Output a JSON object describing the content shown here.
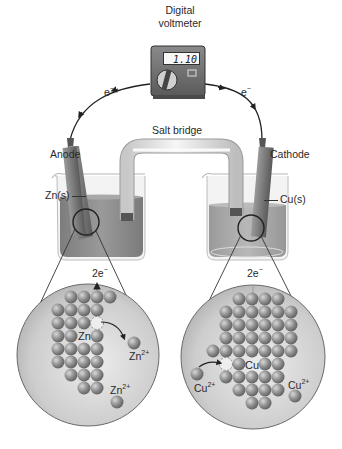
{
  "voltmeter": {
    "label_line1": "Digital",
    "label_line2": "voltmeter",
    "reading": "1.10"
  },
  "wires": {
    "left_electron": "e",
    "right_electron": "e",
    "electron_charge": "−"
  },
  "salt_bridge": {
    "label": "Salt bridge"
  },
  "anode": {
    "label": "Anode",
    "electrode_label": "Zn(s)",
    "electrode_symbol": "Zn",
    "electrode_state": "(s)"
  },
  "cathode": {
    "label": "Cathode",
    "electrode_label": "Cu(s)",
    "electrode_symbol": "Cu",
    "electrode_state": "(s)"
  },
  "zoom_left": {
    "electrons": "2e",
    "electrons_charge": "−",
    "atom_label": "Zn",
    "ion_labels": [
      {
        "base": "Zn",
        "charge": "2+"
      },
      {
        "base": "Zn",
        "charge": "2+"
      }
    ]
  },
  "zoom_right": {
    "electrons": "2e",
    "electrons_charge": "−",
    "atom_label": "Cu",
    "ion_labels": [
      {
        "base": "Cu",
        "charge": "2+"
      },
      {
        "base": "Cu",
        "charge": "2+"
      }
    ]
  },
  "colors": {
    "solution": "#8c8c8c",
    "electrode": "#7a7a7a",
    "atom": "#8a8a8a",
    "circle_bg": "#cfcfcf",
    "glass": "#e6e6e6"
  }
}
